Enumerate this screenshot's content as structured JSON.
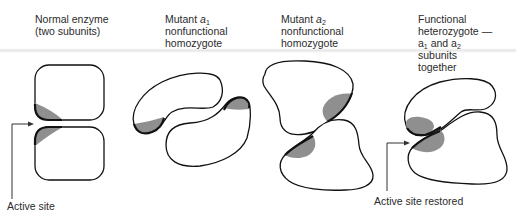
{
  "figure": {
    "panels": [
      {
        "id": "normal",
        "title_lines": [
          "Normal enzyme",
          "(two subunits)"
        ]
      },
      {
        "id": "mutant-a1",
        "title_prefix": "Mutant ",
        "title_var": "a",
        "title_sub": "1",
        "title_lines_rest": [
          "nonfunctional",
          "homozygote"
        ]
      },
      {
        "id": "mutant-a2",
        "title_prefix": "Mutant ",
        "title_var": "a",
        "title_sub": "2",
        "title_lines_rest": [
          "nonfunctional",
          "homozygote"
        ]
      },
      {
        "id": "heterozygote",
        "title_lines": [
          "Functional",
          "heterozygote —"
        ],
        "line3_a": "a",
        "line3_sub1": "1",
        "line3_mid": " and a",
        "line3_sub2": "2",
        "title_lines_end": [
          "subunits",
          "together"
        ]
      }
    ],
    "annotations": {
      "active_site": "Active site",
      "active_site_restored": "Active site restored"
    },
    "colors": {
      "outline": "#111111",
      "active_site_fill": "#8f8f8f",
      "text": "#2b2b2b",
      "background": "#ffffff"
    }
  }
}
